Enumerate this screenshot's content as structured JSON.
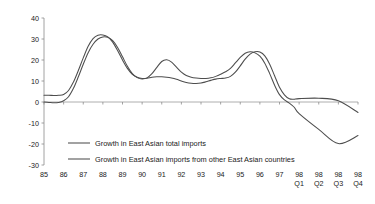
{
  "chart_data": {
    "type": "line",
    "title": "",
    "xlabel": "",
    "ylabel": "",
    "ylim": [
      -30,
      40
    ],
    "yticks": [
      40,
      30,
      20,
      10,
      0,
      -10,
      -20,
      -30
    ],
    "ytick_labels": [
      "40",
      "30",
      "20",
      "10",
      "0",
      "-10",
      "-20",
      "-30"
    ],
    "grid": false,
    "legend_position": "inside-lower-left",
    "categories": [
      "85",
      "86",
      "87",
      "88",
      "89",
      "90",
      "91",
      "92",
      "93",
      "94",
      "95",
      "96",
      "97",
      "98 Q1",
      "98 Q2",
      "98 Q3",
      "98 Q4"
    ],
    "xtick_labels": [
      {
        "year": "85",
        "quarter": ""
      },
      {
        "year": "86",
        "quarter": ""
      },
      {
        "year": "87",
        "quarter": ""
      },
      {
        "year": "88",
        "quarter": ""
      },
      {
        "year": "89",
        "quarter": ""
      },
      {
        "year": "90",
        "quarter": ""
      },
      {
        "year": "91",
        "quarter": ""
      },
      {
        "year": "92",
        "quarter": ""
      },
      {
        "year": "93",
        "quarter": ""
      },
      {
        "year": "94",
        "quarter": ""
      },
      {
        "year": "95",
        "quarter": ""
      },
      {
        "year": "96",
        "quarter": ""
      },
      {
        "year": "97",
        "quarter": ""
      },
      {
        "year": "98",
        "quarter": "Q1"
      },
      {
        "year": "98",
        "quarter": "Q2"
      },
      {
        "year": "98",
        "quarter": "Q3"
      },
      {
        "year": "98",
        "quarter": "Q4"
      }
    ],
    "series": [
      {
        "name": "Growth in East Asian total imports",
        "color": "#4d4d4d",
        "x": [
          0,
          0.25,
          0.5,
          0.75,
          1.0,
          1.25,
          1.5,
          1.75,
          2.0,
          2.25,
          2.5,
          2.75,
          3.0,
          3.25,
          3.5,
          3.75,
          4.0,
          4.25,
          4.5,
          4.75,
          5.0,
          5.25,
          5.5,
          5.75,
          6.0,
          6.25,
          6.5,
          6.75,
          7.0,
          7.25,
          7.5,
          7.75,
          8.0,
          8.25,
          8.5,
          8.75,
          9.0,
          9.25,
          9.5,
          9.75,
          10.0,
          10.25,
          10.5,
          10.75,
          11.0,
          11.25,
          11.5,
          11.75,
          12.0,
          12.25,
          12.5,
          12.75,
          13.0,
          14.0,
          15.0,
          16.0
        ],
        "y": [
          3.2,
          3.2,
          3.1,
          3.2,
          3.6,
          5.5,
          9.5,
          15.0,
          21.0,
          26.5,
          30.2,
          31.8,
          31.9,
          31.0,
          28.5,
          24.5,
          20.0,
          16.0,
          13.2,
          11.8,
          11.2,
          11.3,
          11.8,
          12.0,
          12.0,
          11.8,
          11.4,
          10.8,
          10.0,
          9.3,
          8.9,
          8.8,
          9.0,
          9.6,
          10.3,
          10.9,
          11.2,
          11.4,
          12.2,
          14.2,
          17.2,
          20.4,
          22.8,
          23.9,
          23.8,
          22.0,
          18.0,
          12.5,
          7.0,
          3.4,
          1.5,
          1.3,
          1.6,
          1.8,
          0.6,
          -5.0
        ],
        "y_end_points": [
          -13.5,
          -19.5,
          -19.6
        ],
        "description": "Starts near 3 in 1985, rises to a peak of about 32 in late 1987, falls to about 11 by 1989, stays near 11-12 through 1990, dips to about 9 in 1992, rises to a second peak of about 24 in late 1994, declines sharply through 1995-1996, flattens near 1-2 through 1997, then falls steeply to about -20 by 1998 Q3 before ending near -19.5 in 1998 Q4"
      },
      {
        "name": "Growth in East Asian imports from other East Asian countries",
        "color": "#4d4d4d",
        "x": [
          0,
          0.25,
          0.5,
          0.75,
          1.0,
          1.25,
          1.5,
          1.75,
          2.0,
          2.25,
          2.5,
          2.75,
          3.0,
          3.25,
          3.5,
          3.75,
          4.0,
          4.25,
          4.5,
          4.75,
          5.0,
          5.25,
          5.5,
          5.75,
          6.0,
          6.25,
          6.5,
          6.75,
          7.0,
          7.25,
          7.5,
          7.75,
          8.0,
          8.25,
          8.5,
          8.75,
          9.0,
          9.25,
          9.5,
          9.75,
          10.0,
          10.25,
          10.5,
          10.75,
          11.0,
          11.25,
          11.5,
          11.75,
          12.0,
          12.25,
          12.5,
          12.75,
          13.0,
          14.0,
          15.0,
          16.0
        ],
        "y": [
          0.0,
          -0.2,
          -0.4,
          -0.2,
          0.6,
          2.5,
          6.5,
          12.0,
          18.0,
          23.5,
          27.5,
          30.0,
          31.0,
          30.8,
          29.2,
          26.0,
          21.5,
          17.0,
          13.5,
          11.6,
          11.0,
          11.5,
          13.5,
          16.5,
          19.3,
          20.1,
          19.0,
          16.6,
          14.2,
          12.6,
          11.8,
          11.4,
          11.2,
          11.2,
          11.5,
          12.2,
          13.2,
          14.4,
          16.0,
          18.6,
          21.2,
          23.2,
          23.9,
          23.4,
          21.8,
          18.5,
          13.5,
          8.0,
          3.5,
          1.0,
          -0.5,
          -2.5,
          -5.5,
          -13.0,
          -19.8,
          -16.0
        ],
        "description": "Starts at 0 in 1985, rises to a peak of about 31 in 1988, falls to about 11 by 1989, rises to a local peak of about 20 in 1991, falls back to about 11 in 1992-1993, rises to a second peak of about 24 in late 1994, then declines steadily through 1996 crossing zero in mid-1996, falling to a trough of about -20 at 1998 Q3 before recovering to about -16 in 1998 Q4"
      }
    ]
  },
  "legend": {
    "entries": [
      {
        "label": "Growth in East Asian total imports"
      },
      {
        "label": "Growth in East Asian imports from other East Asian countries"
      }
    ]
  },
  "colors": {
    "line": "#4d4d4d",
    "axis": "#8c8c8c",
    "text": "#1a1a1a",
    "background": "#ffffff"
  }
}
